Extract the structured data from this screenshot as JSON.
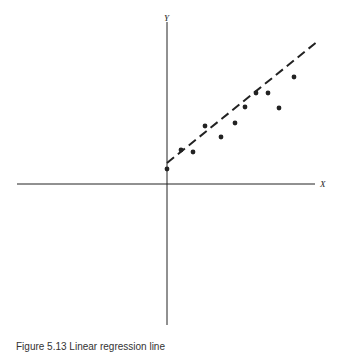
{
  "figure": {
    "axis_labels": {
      "x": "X",
      "y": "Y"
    },
    "caption": "Figure 5.13 Linear regression line"
  },
  "colors": {
    "ink": "#222222",
    "background": "#ffffff"
  },
  "chart_data": {
    "type": "scatter",
    "title": "",
    "xlabel": "X",
    "ylabel": "Y",
    "grid": false,
    "legend": null,
    "axes_style": "cartesian crosshair, no ticks",
    "points": [
      {
        "x": 0.0,
        "y": 1.5
      },
      {
        "x": 1.4,
        "y": 3.4
      },
      {
        "x": 2.6,
        "y": 3.2
      },
      {
        "x": 3.8,
        "y": 5.8
      },
      {
        "x": 5.4,
        "y": 4.7
      },
      {
        "x": 6.8,
        "y": 6.1
      },
      {
        "x": 7.8,
        "y": 7.7
      },
      {
        "x": 8.9,
        "y": 9.1
      },
      {
        "x": 10.1,
        "y": 9.1
      },
      {
        "x": 11.2,
        "y": 7.6
      },
      {
        "x": 12.7,
        "y": 10.7
      }
    ],
    "fit_line": {
      "style": "dashed",
      "x0": 0.0,
      "y0": 2.1,
      "x1": 15.1,
      "y1": 14.3
    },
    "pixel_mapping": {
      "origin_px": [
        167,
        184
      ],
      "px_per_unit": 10
    },
    "xlim": [
      -15,
      14.8
    ],
    "ylim": [
      -14.1,
      16.2
    ]
  }
}
